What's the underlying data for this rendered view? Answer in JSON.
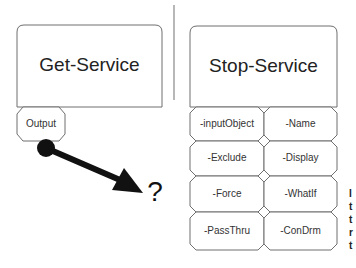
{
  "left": {
    "cmdlet": "Get-Service",
    "output_tab": "Output",
    "connector_target": "?"
  },
  "right": {
    "cmdlet": "Stop-Service",
    "parameters": [
      [
        "-inputObject",
        "-Name"
      ],
      [
        "-Exclude",
        "-Display"
      ],
      [
        "-Force",
        "-WhatIf"
      ],
      [
        "-PassThru",
        "-ConDrm"
      ]
    ]
  },
  "clipped_text": [
    "I",
    "t",
    "t",
    "r",
    "t"
  ],
  "colors": {
    "stroke": "#6f6f6f",
    "arrow": "#111111",
    "background": "#ffffff"
  }
}
